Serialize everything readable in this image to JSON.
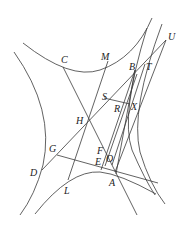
{
  "diagram": {
    "type": "geometric-construction",
    "labels": {
      "C": "C",
      "M": "M",
      "B": "B",
      "T": "T",
      "U": "U",
      "S": "S",
      "R": "R",
      "X": "X",
      "H": "H",
      "G": "G",
      "D": "D",
      "F": "F",
      "E": "E",
      "O": "O",
      "A": "A",
      "L": "L"
    },
    "stroke_color": "#3a3a3a",
    "background": "#ffffff"
  }
}
